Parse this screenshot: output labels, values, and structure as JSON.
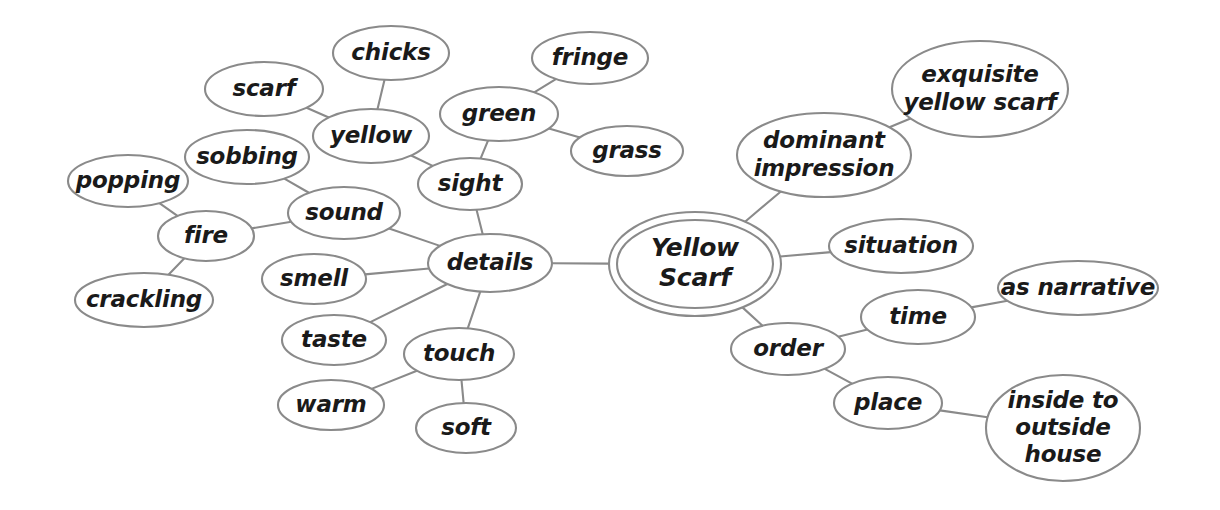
{
  "diagram": {
    "title": "Yellow Scarf",
    "type": "mind-map",
    "background_color": "#ffffff",
    "stroke_color": "#8a8a8a",
    "text_color": "#1a1a1a"
  },
  "nodes": [
    {
      "id": "yellow_scarf",
      "label": "Yellow Scarf",
      "lines": [
        "Yellow",
        "Scarf"
      ],
      "cx": 695,
      "cy": 264,
      "rx": 78,
      "ry": 44,
      "double": true,
      "font_size": 25
    },
    {
      "id": "details",
      "label": "details",
      "lines": [
        "details"
      ],
      "cx": 490,
      "cy": 263,
      "rx": 62,
      "ry": 29,
      "double": false,
      "font_size": 23
    },
    {
      "id": "sight",
      "label": "sight",
      "lines": [
        "sight"
      ],
      "cx": 470,
      "cy": 184,
      "rx": 52,
      "ry": 26,
      "double": false,
      "font_size": 23
    },
    {
      "id": "sound",
      "label": "sound",
      "lines": [
        "sound"
      ],
      "cx": 344,
      "cy": 213,
      "rx": 56,
      "ry": 26,
      "double": false,
      "font_size": 23
    },
    {
      "id": "smell",
      "label": "smell",
      "lines": [
        "smell"
      ],
      "cx": 314,
      "cy": 279,
      "rx": 52,
      "ry": 25,
      "double": false,
      "font_size": 23
    },
    {
      "id": "taste",
      "label": "taste",
      "lines": [
        "taste"
      ],
      "cx": 334,
      "cy": 340,
      "rx": 52,
      "ry": 25,
      "double": false,
      "font_size": 23
    },
    {
      "id": "touch",
      "label": "touch",
      "lines": [
        "touch"
      ],
      "cx": 459,
      "cy": 354,
      "rx": 55,
      "ry": 26,
      "double": false,
      "font_size": 23
    },
    {
      "id": "warm",
      "label": "warm",
      "lines": [
        "warm"
      ],
      "cx": 331,
      "cy": 405,
      "rx": 53,
      "ry": 25,
      "double": false,
      "font_size": 23
    },
    {
      "id": "soft",
      "label": "soft",
      "lines": [
        "soft"
      ],
      "cx": 466,
      "cy": 428,
      "rx": 50,
      "ry": 25,
      "double": false,
      "font_size": 23
    },
    {
      "id": "yellow",
      "label": "yellow",
      "lines": [
        "yellow"
      ],
      "cx": 371,
      "cy": 136,
      "rx": 58,
      "ry": 27,
      "double": false,
      "font_size": 23
    },
    {
      "id": "scarf",
      "label": "scarf",
      "lines": [
        "scarf"
      ],
      "cx": 264,
      "cy": 89,
      "rx": 59,
      "ry": 27,
      "double": false,
      "font_size": 23
    },
    {
      "id": "chicks",
      "label": "chicks",
      "lines": [
        "chicks"
      ],
      "cx": 391,
      "cy": 53,
      "rx": 58,
      "ry": 27,
      "double": false,
      "font_size": 23
    },
    {
      "id": "sobbing",
      "label": "sobbing",
      "lines": [
        "sobbing"
      ],
      "cx": 247,
      "cy": 157,
      "rx": 62,
      "ry": 27,
      "double": false,
      "font_size": 23
    },
    {
      "id": "fire",
      "label": "fire",
      "lines": [
        "fire"
      ],
      "cx": 206,
      "cy": 236,
      "rx": 48,
      "ry": 25,
      "double": false,
      "font_size": 23
    },
    {
      "id": "popping",
      "label": "popping",
      "lines": [
        "popping"
      ],
      "cx": 128,
      "cy": 181,
      "rx": 60,
      "ry": 26,
      "double": false,
      "font_size": 23
    },
    {
      "id": "crackling",
      "label": "crackling",
      "lines": [
        "crackling"
      ],
      "cx": 144,
      "cy": 300,
      "rx": 69,
      "ry": 27,
      "double": false,
      "font_size": 23
    },
    {
      "id": "green",
      "label": "green",
      "lines": [
        "green"
      ],
      "cx": 499,
      "cy": 114,
      "rx": 59,
      "ry": 27,
      "double": false,
      "font_size": 23
    },
    {
      "id": "fringe",
      "label": "fringe",
      "lines": [
        "fringe"
      ],
      "cx": 590,
      "cy": 58,
      "rx": 58,
      "ry": 26,
      "double": false,
      "font_size": 23
    },
    {
      "id": "grass",
      "label": "grass",
      "lines": [
        "grass"
      ],
      "cx": 627,
      "cy": 151,
      "rx": 56,
      "ry": 25,
      "double": false,
      "font_size": 23
    },
    {
      "id": "dominant",
      "label": "dominant impression",
      "lines": [
        "dominant",
        "impression"
      ],
      "cx": 824,
      "cy": 155,
      "rx": 87,
      "ry": 42,
      "double": false,
      "font_size": 23
    },
    {
      "id": "exquisite",
      "label": "exquisite yellow scarf",
      "lines": [
        "exquisite",
        "yellow scarf"
      ],
      "cx": 980,
      "cy": 89,
      "rx": 88,
      "ry": 48,
      "double": false,
      "font_size": 23
    },
    {
      "id": "situation",
      "label": "situation",
      "lines": [
        "situation"
      ],
      "cx": 901,
      "cy": 246,
      "rx": 72,
      "ry": 27,
      "double": false,
      "font_size": 23
    },
    {
      "id": "order",
      "label": "order",
      "lines": [
        "order"
      ],
      "cx": 788,
      "cy": 349,
      "rx": 57,
      "ry": 26,
      "double": false,
      "font_size": 23
    },
    {
      "id": "time",
      "label": "time",
      "lines": [
        "time"
      ],
      "cx": 918,
      "cy": 317,
      "rx": 57,
      "ry": 27,
      "double": false,
      "font_size": 23
    },
    {
      "id": "as_narrative",
      "label": "as narrative",
      "lines": [
        "as narrative"
      ],
      "cx": 1078,
      "cy": 288,
      "rx": 80,
      "ry": 27,
      "double": false,
      "font_size": 23
    },
    {
      "id": "place",
      "label": "place",
      "lines": [
        "place"
      ],
      "cx": 888,
      "cy": 403,
      "rx": 54,
      "ry": 26,
      "double": false,
      "font_size": 23
    },
    {
      "id": "inside_outside",
      "label": "inside to outside house",
      "lines": [
        "inside to",
        "outside",
        "house"
      ],
      "cx": 1063,
      "cy": 428,
      "rx": 77,
      "ry": 53,
      "double": false,
      "font_size": 23
    }
  ],
  "edges": [
    {
      "from": "yellow_scarf",
      "to": "details"
    },
    {
      "from": "yellow_scarf",
      "to": "dominant"
    },
    {
      "from": "yellow_scarf",
      "to": "situation"
    },
    {
      "from": "yellow_scarf",
      "to": "order"
    },
    {
      "from": "dominant",
      "to": "exquisite"
    },
    {
      "from": "order",
      "to": "time"
    },
    {
      "from": "order",
      "to": "place"
    },
    {
      "from": "time",
      "to": "as_narrative"
    },
    {
      "from": "place",
      "to": "inside_outside"
    },
    {
      "from": "details",
      "to": "sight"
    },
    {
      "from": "details",
      "to": "sound"
    },
    {
      "from": "details",
      "to": "smell"
    },
    {
      "from": "details",
      "to": "taste"
    },
    {
      "from": "details",
      "to": "touch"
    },
    {
      "from": "touch",
      "to": "warm"
    },
    {
      "from": "touch",
      "to": "soft"
    },
    {
      "from": "sight",
      "to": "yellow"
    },
    {
      "from": "sight",
      "to": "green"
    },
    {
      "from": "yellow",
      "to": "scarf"
    },
    {
      "from": "yellow",
      "to": "chicks"
    },
    {
      "from": "green",
      "to": "fringe"
    },
    {
      "from": "green",
      "to": "grass"
    },
    {
      "from": "sound",
      "to": "sobbing"
    },
    {
      "from": "sound",
      "to": "fire"
    },
    {
      "from": "fire",
      "to": "popping"
    },
    {
      "from": "fire",
      "to": "crackling"
    }
  ]
}
